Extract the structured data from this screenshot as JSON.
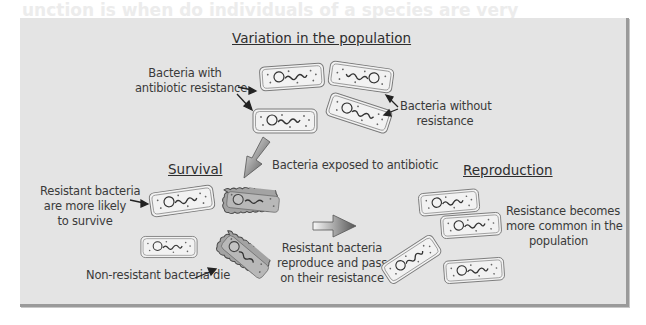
{
  "diagram": {
    "title": "Variation in the population",
    "background_text": {
      "line1": "unction is when do individuals of a species are very",
      "line2": "do the same respect for these organisms"
    },
    "sections": {
      "variation": {
        "heading": "Variation in the population",
        "label_resistant": [
          "Bacteria with",
          "antibiotic resistance"
        ],
        "label_non_resistant": [
          "Bacteria without",
          "resistance"
        ]
      },
      "exposure": {
        "label": "Bacteria exposed to antibiotic"
      },
      "survival": {
        "heading": "Survival",
        "label_survive": [
          "Resistant bacteria",
          "are more likely",
          "to survive"
        ],
        "label_die": "Non-resistant bacteria die"
      },
      "transition": {
        "label": [
          "Resistant bacteria",
          "reproduce and pass",
          "on their resistance"
        ]
      },
      "reproduction": {
        "heading": "Reproduction",
        "label": [
          "Resistance becomes",
          "more common in the",
          "population"
        ]
      }
    },
    "colors": {
      "panel_bg": "#e4e4e4",
      "panel_shadow": "#9a9a9a",
      "cell_fill": "#f2f2f2",
      "dead_cell_fill": "#9e9e9e",
      "text": "#3a3a3a"
    }
  }
}
